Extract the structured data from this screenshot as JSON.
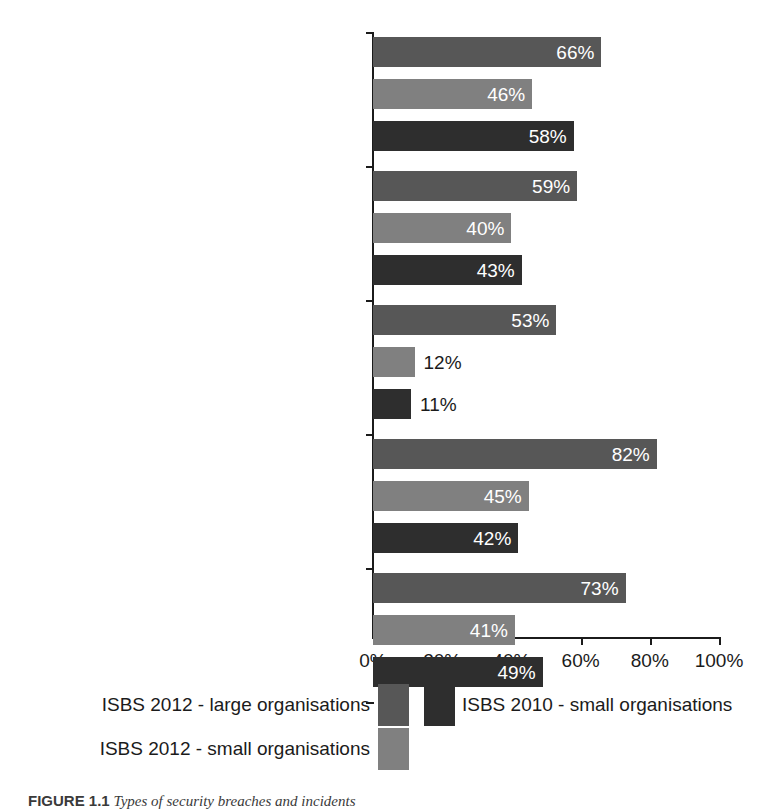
{
  "chart_data": {
    "type": "bar",
    "orientation": "horizontal",
    "title": "",
    "xlabel": "",
    "ylabel": "",
    "xlim": [
      0,
      100
    ],
    "xticks": [
      "0%",
      "20%",
      "40%",
      "60%",
      "80%",
      "100%"
    ],
    "xtick_values": [
      0,
      20,
      40,
      60,
      80,
      100
    ],
    "grid": false,
    "legend_position": "bottom",
    "categories": [
      "Systems failure or data corruption",
      "Infection by viruses or\nmalicious software",
      "Theft or fraud involving computers",
      "Other incidents caused by staff",
      "Attacks by an unauthorised outsider\n(including hacking attempts)"
    ],
    "series": [
      {
        "name": "ISBS 2012 - large organisations",
        "color": "#575757",
        "values": [
          66,
          59,
          53,
          82,
          73
        ],
        "labels": [
          "66%",
          "59%",
          "53%",
          "82%",
          "73%"
        ]
      },
      {
        "name": "ISBS 2012 - small organisations",
        "color": "#808080",
        "values": [
          46,
          40,
          12,
          45,
          41
        ],
        "labels": [
          "46%",
          "40%",
          "12%",
          "45%",
          "41%"
        ]
      },
      {
        "name": "ISBS 2010 - small organisations",
        "color": "#2e2e2e",
        "values": [
          58,
          43,
          11,
          42,
          49
        ],
        "labels": [
          "58%",
          "43%",
          "11%",
          "42%",
          "49%"
        ]
      }
    ]
  },
  "legend": {
    "entries": [
      {
        "label": "ISBS 2012 - large organisations",
        "color": "#575757"
      },
      {
        "label": "ISBS 2010 - small organisations",
        "color": "#2e2e2e"
      },
      {
        "label": "ISBS 2012 - small organisations",
        "color": "#808080"
      }
    ]
  },
  "caption": {
    "number": "FIGURE 1.1",
    "text": "Types of  security breaches and incidents"
  }
}
